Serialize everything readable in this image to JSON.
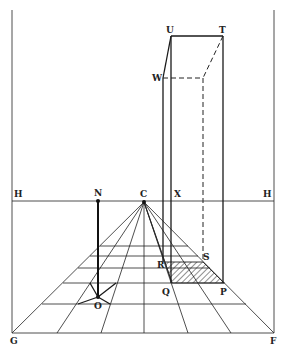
{
  "diagram": {
    "labels": {
      "U": "U",
      "T": "T",
      "W": "W",
      "H_left": "H",
      "N": "N",
      "C": "C",
      "X": "X",
      "H_right": "H",
      "R": "R",
      "S": "S",
      "Q": "Q",
      "P": "P",
      "O": "O",
      "G": "G",
      "F": "F"
    },
    "colors": {
      "ink": "#1a1a1a",
      "background": "#ffffff"
    }
  }
}
